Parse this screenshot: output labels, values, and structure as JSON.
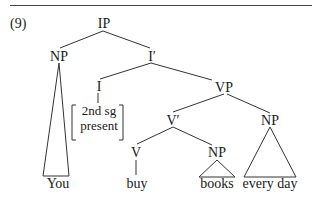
{
  "example_number": "(9)",
  "tree": {
    "root": "IP",
    "nodes": {
      "ip": "IP",
      "np_subject": "NP",
      "i_bar": "I′",
      "i": "I",
      "vp": "VP",
      "v_bar": "V′",
      "np_adjunct": "NP",
      "v": "V",
      "np_object": "NP"
    },
    "features": {
      "line1": "2nd sg",
      "line2": "present"
    },
    "leaves": {
      "subject": "You",
      "verb": "buy",
      "object": "books",
      "adjunct": "every day"
    }
  }
}
